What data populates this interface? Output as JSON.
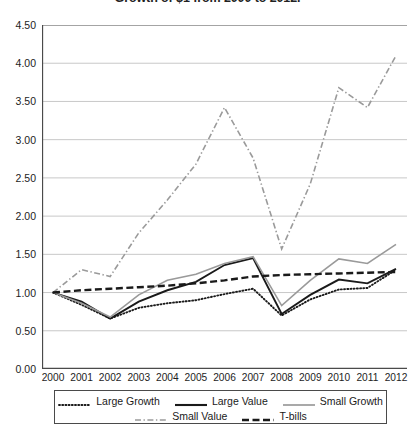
{
  "chart_data": {
    "type": "line",
    "title": "Growth of $1 from 2000 to 2012.",
    "xlabel": "",
    "ylabel": "",
    "x": [
      2000,
      2001,
      2002,
      2003,
      2004,
      2005,
      2006,
      2007,
      2008,
      2009,
      2010,
      2011,
      2012
    ],
    "categories": [
      "2000",
      "2001",
      "2002",
      "2003",
      "2004",
      "2005",
      "2006",
      "2007",
      "2008",
      "2009",
      "2010",
      "2011",
      "2012"
    ],
    "ylim": [
      0.0,
      4.5
    ],
    "yticks": [
      "0.00",
      "0.50",
      "1.00",
      "1.50",
      "2.00",
      "2.50",
      "3.00",
      "3.50",
      "4.00",
      "4.50"
    ],
    "ytick_values": [
      0.0,
      0.5,
      1.0,
      1.5,
      2.0,
      2.5,
      3.0,
      3.5,
      4.0,
      4.5
    ],
    "grid": true,
    "legend_position": "bottom",
    "series": [
      {
        "name": "Large Growth",
        "style": "dotted",
        "color": "#1a1a1a",
        "width": 1.9,
        "values": [
          1.0,
          0.84,
          0.66,
          0.8,
          0.86,
          0.9,
          0.98,
          1.05,
          0.7,
          0.91,
          1.04,
          1.06,
          1.3
        ]
      },
      {
        "name": "Large Value",
        "style": "solid",
        "color": "#1a1a1a",
        "width": 1.9,
        "values": [
          1.0,
          0.88,
          0.66,
          0.88,
          1.03,
          1.14,
          1.36,
          1.45,
          0.72,
          0.97,
          1.17,
          1.12,
          1.31
        ]
      },
      {
        "name": "Small Growth",
        "style": "solid",
        "color": "#9a9a9a",
        "width": 1.6,
        "values": [
          1.0,
          0.86,
          0.68,
          0.97,
          1.16,
          1.24,
          1.38,
          1.47,
          0.83,
          1.16,
          1.44,
          1.38,
          1.63
        ]
      },
      {
        "name": "Small Value",
        "style": "dash-dot",
        "color": "#9a9a9a",
        "width": 1.6,
        "values": [
          1.0,
          1.3,
          1.21,
          1.78,
          2.21,
          2.68,
          3.42,
          2.76,
          1.57,
          2.42,
          3.68,
          3.42,
          4.1
        ]
      },
      {
        "name": "T-bills",
        "style": "dashed",
        "color": "#1a1a1a",
        "width": 2.4,
        "values": [
          1.0,
          1.03,
          1.05,
          1.07,
          1.09,
          1.12,
          1.16,
          1.21,
          1.23,
          1.24,
          1.25,
          1.26,
          1.27
        ]
      }
    ]
  },
  "legend": {
    "row1": [
      {
        "label": "Large Growth",
        "style": "dotted",
        "color": "#1a1a1a"
      },
      {
        "label": "Large Value",
        "style": "solid",
        "color": "#1a1a1a"
      },
      {
        "label": "Small Growth",
        "style": "solid",
        "color": "#9a9a9a"
      }
    ],
    "row2": [
      {
        "label": "Small Value",
        "style": "dash-dot",
        "color": "#9a9a9a"
      },
      {
        "label": "T-bills",
        "style": "dashed",
        "color": "#1a1a1a"
      }
    ]
  }
}
